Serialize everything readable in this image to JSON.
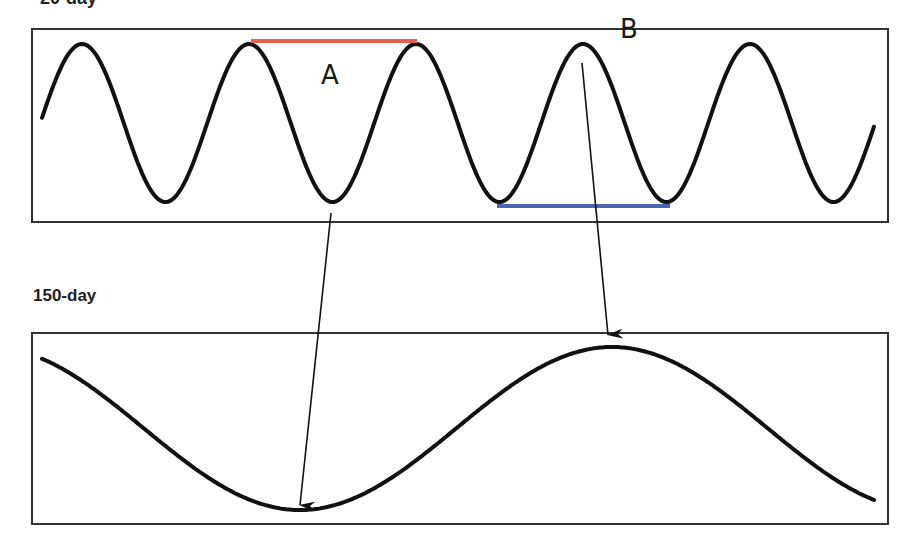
{
  "labels": {
    "top_panel": "20-day",
    "bottom_panel": "150-day",
    "marker_a": "A",
    "marker_b": "B"
  },
  "colors": {
    "curve": "#111111",
    "frame": "#333333",
    "line_a": "#e8604c",
    "line_b": "#4a67b0",
    "arrow": "#111111"
  },
  "chart_data": [
    {
      "type": "line",
      "title": "20-day",
      "description": "Short-cycle sine wave, ~5 cycles across panel",
      "peaks_x_px": [
        82,
        249,
        415,
        583,
        750
      ],
      "troughs_x_px": [
        166,
        332,
        499,
        667,
        833
      ],
      "period_px": 167,
      "annotations": [
        {
          "label": "A",
          "type": "peak-to-peak span",
          "color": "#e8604c",
          "from_x": 251,
          "to_x": 417
        },
        {
          "label": "B",
          "type": "trough-to-trough span",
          "color": "#4a67b0",
          "from_x": 497,
          "to_x": 670
        }
      ]
    },
    {
      "type": "line",
      "title": "150-day",
      "description": "Long-cycle wave; trough aligns under 20-day trough (A arrow), peak aligns under 20-day peak (B arrow)",
      "trough_x_px": 300,
      "peak_x_px": 612
    }
  ]
}
